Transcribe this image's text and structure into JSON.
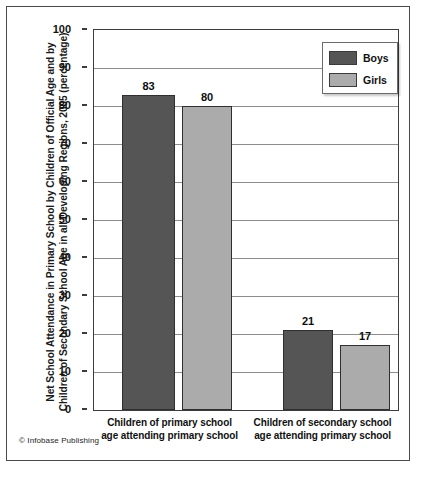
{
  "figure": {
    "credit": "© Infobase Publishing"
  },
  "chart_data": {
    "type": "bar",
    "title": "",
    "ylabel": "Net School Attendance in Primary School by Children of Official Age and by Children of Secondary School Age in all Developing Regions, 2005 (percentage)",
    "ylabel_lines": [
      "Net School Attendance in Primary School by Children of Official",
      "Age and by Children of Secondary School Age in all",
      "Developing Regions, 2005 (percentage)"
    ],
    "xlabel": "",
    "categories": [
      "Children of primary school age attending primary school",
      "Children of secondary school age attending primary school"
    ],
    "category_lines": [
      {
        "line1": "Children of primary school",
        "line2": "age attending primary school"
      },
      {
        "line1": "Children of secondary school",
        "line2": "age attending primary school"
      }
    ],
    "series": [
      {
        "name": "Boys",
        "color": "#555555",
        "values": [
          83,
          80
        ]
      },
      {
        "name": "Girls",
        "color": "#ababab",
        "values": [
          80,
          17
        ]
      }
    ],
    "bars": [
      {
        "group": 0,
        "series": "Boys",
        "value": 83,
        "label": "83"
      },
      {
        "group": 0,
        "series": "Girls",
        "value": 80,
        "label": "80"
      },
      {
        "group": 1,
        "series": "Boys",
        "value": 21,
        "label": "21"
      },
      {
        "group": 1,
        "series": "Girls",
        "value": 17,
        "label": "17"
      }
    ],
    "ylim": [
      0,
      100
    ],
    "ytick_step": 10,
    "yticks": [
      0,
      10,
      20,
      30,
      40,
      50,
      60,
      70,
      80,
      90,
      100
    ],
    "ytick_labels": [
      "0",
      "10",
      "20",
      "30",
      "40",
      "50",
      "60",
      "70",
      "80",
      "90",
      "100"
    ],
    "grid": true,
    "legend": {
      "position": "top-right",
      "entries": [
        {
          "label": "Boys",
          "color": "#555555"
        },
        {
          "label": "Girls",
          "color": "#ababab"
        }
      ]
    }
  }
}
